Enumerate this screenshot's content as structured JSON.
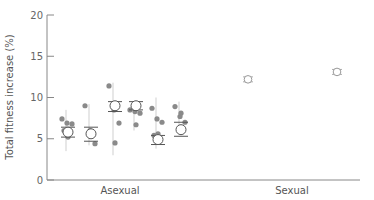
{
  "chart_data": {
    "type": "scatter",
    "title": "",
    "xlabel": "",
    "ylabel": "Total fitness increase (%)",
    "ylim": [
      0,
      20
    ],
    "yticks": [
      0,
      5,
      10,
      15,
      20
    ],
    "grid": false,
    "legend": null,
    "categories": [
      "Asexual",
      "Sexual"
    ],
    "series": [
      {
        "name": "Asexual",
        "groups": [
          {
            "mean": 5.8,
            "ci": [
              5.2,
              6.4
            ],
            "replicates": [
              7.4,
              6.9,
              6.8,
              5.2,
              6.0
            ],
            "err_low": 3.5,
            "err_high": 8.5
          },
          {
            "mean": 5.6,
            "ci": [
              4.7,
              6.4
            ],
            "replicates": [
              9.0,
              6.0,
              4.4
            ],
            "err_low": 4.2,
            "err_high": 9.2
          },
          {
            "mean": 9.0,
            "ci": [
              8.3,
              9.5
            ],
            "replicates": [
              11.4,
              8.5,
              6.9,
              4.5
            ],
            "err_low": 3.0,
            "err_high": 11.8
          },
          {
            "mean": 9.0,
            "ci": [
              8.5,
              9.5
            ],
            "replicates": [
              8.5,
              8.3,
              8.1,
              6.7
            ],
            "err_low": 6.0,
            "err_high": 9.4
          },
          {
            "mean": 4.9,
            "ci": [
              4.3,
              5.4
            ],
            "replicates": [
              8.7,
              7.4,
              7.0,
              5.6,
              5.4
            ],
            "err_low": 3.8,
            "err_high": 10.0
          },
          {
            "mean": 6.1,
            "ci": [
              5.3,
              7.0
            ],
            "replicates": [
              8.9,
              7.7,
              7.0,
              8.1
            ],
            "err_low": 5.8,
            "err_high": 9.5
          }
        ]
      },
      {
        "name": "Sexual",
        "groups": [
          {
            "mean": 12.2,
            "ci": [
              11.9,
              12.5
            ],
            "replicates": [],
            "err_low": 11.9,
            "err_high": 12.5
          },
          {
            "mean": 13.1,
            "ci": [
              12.8,
              13.4
            ],
            "replicates": [],
            "err_low": 12.8,
            "err_high": 13.4
          }
        ]
      }
    ]
  },
  "labels": {
    "ylabel": "Total fitness increase (%)",
    "x_categories": [
      "Asexual",
      "Sexual"
    ],
    "yticks": [
      "0",
      "5",
      "10",
      "15",
      "20"
    ]
  },
  "colors": {
    "axis": "#888888",
    "replicate_dot": "#8a8a8a",
    "mean_marker_fill": "#ffffff",
    "mean_marker_stroke": "#555555",
    "sexual_marker_stroke": "#999999",
    "text": "#555555"
  }
}
